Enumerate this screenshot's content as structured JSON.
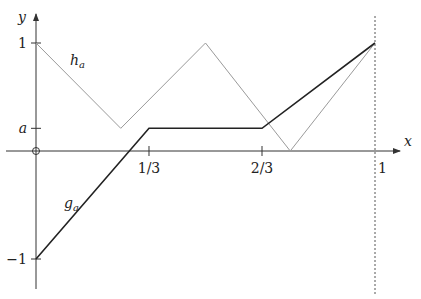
{
  "diagram": {
    "x_axis_label": "x",
    "y_axis_label": "y",
    "x_ticks": [
      {
        "value": 0.3333333,
        "label": "1/3"
      },
      {
        "value": 0.6666667,
        "label": "2/3"
      },
      {
        "value": 1,
        "label": "1"
      }
    ],
    "y_ticks": [
      {
        "value": 1,
        "label": "1"
      },
      {
        "value": 0.21,
        "label": "a"
      },
      {
        "value": -1,
        "label": "−1"
      }
    ],
    "a_value": 0.21,
    "origin_marker": "circle",
    "vertical_dashed_line_x": 1,
    "functions": [
      {
        "name": "h",
        "label_main": "h",
        "label_sub": "a",
        "color": "#9a9a9a",
        "points": [
          [
            0,
            1
          ],
          [
            0.25,
            0.21
          ],
          [
            0.5,
            1
          ],
          [
            0.75,
            0
          ],
          [
            1,
            1
          ]
        ]
      },
      {
        "name": "g",
        "label_main": "g",
        "label_sub": "a",
        "color": "#222222",
        "points": [
          [
            0,
            -1
          ],
          [
            0.3333333,
            0.21
          ],
          [
            0.6666667,
            0.21
          ],
          [
            1,
            1
          ]
        ]
      }
    ]
  }
}
